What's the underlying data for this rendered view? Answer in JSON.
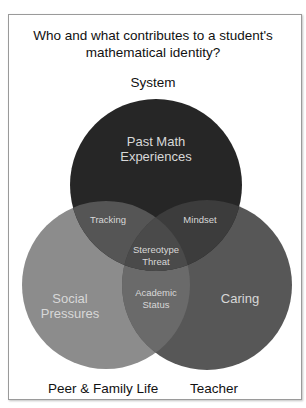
{
  "title": {
    "line1": "Who and what contributes to a student's",
    "line2": "mathematical identity?"
  },
  "sets": {
    "top": {
      "label": "System",
      "region": [
        "Past Math",
        "Experiences"
      ],
      "color": "#262626"
    },
    "left": {
      "label": "Peer & Family Life",
      "region": [
        "Social",
        "Pressures"
      ],
      "color": "#8c8c8c"
    },
    "right": {
      "label": "Teacher",
      "region": [
        "Caring"
      ],
      "color": "#575757"
    }
  },
  "intersections": {
    "top_left": [
      "Tracking"
    ],
    "top_right": [
      "Mindset"
    ],
    "left_right": [
      "Academic",
      "Status"
    ],
    "all": [
      "Stereotype",
      "Threat"
    ]
  }
}
